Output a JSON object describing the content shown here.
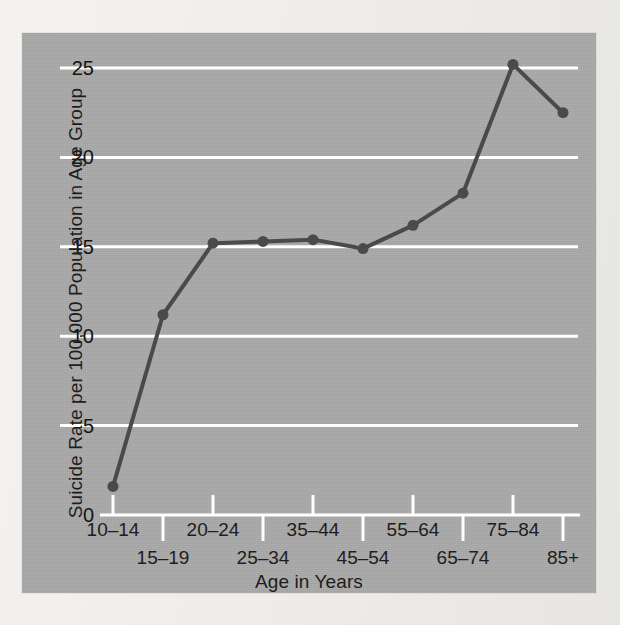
{
  "chart_data": {
    "type": "line",
    "title": "",
    "xlabel": "Age in Years",
    "ylabel": "Suicide Rate per 100,000 Population in Age Group",
    "categories": [
      "10–14",
      "15–19",
      "20–24",
      "25–34",
      "35–44",
      "45–54",
      "55–64",
      "65–74",
      "75–84",
      "85+"
    ],
    "values": [
      1.6,
      11.2,
      15.2,
      15.3,
      15.4,
      14.9,
      16.2,
      18.0,
      25.2,
      22.5
    ],
    "ylim": [
      0,
      26.5
    ],
    "yticks": [
      0,
      5,
      10,
      15,
      20,
      25
    ],
    "ytick_labels": [
      "0",
      "5",
      "10",
      "15",
      "20",
      "25"
    ],
    "grid": "horizontal-white-gridlines",
    "legend": "none",
    "series_color": "#4a4a4a",
    "gridline_color": "#ffffff",
    "plot_background": "#a9a9a9",
    "page_background": "#f3f1ed",
    "marker": "circle"
  },
  "axis_titles": {
    "x": "Age in Years",
    "y": "Suicide Rate per 100,000 Population in Age Group"
  },
  "y_ticks": [
    {
      "label": "25",
      "value": 25
    },
    {
      "label": "20",
      "value": 20
    },
    {
      "label": "15",
      "value": 15
    },
    {
      "label": "10",
      "value": 10
    },
    {
      "label": "5",
      "value": 5
    },
    {
      "label": "0",
      "value": 0
    }
  ],
  "x_ticks": [
    {
      "label": "10–14",
      "row": 0
    },
    {
      "label": "15–19",
      "row": 1
    },
    {
      "label": "20–24",
      "row": 0
    },
    {
      "label": "25–34",
      "row": 1
    },
    {
      "label": "35–44",
      "row": 0
    },
    {
      "label": "45–54",
      "row": 1
    },
    {
      "label": "55–64",
      "row": 0
    },
    {
      "label": "65–74",
      "row": 1
    },
    {
      "label": "75–84",
      "row": 0
    },
    {
      "label": "85+",
      "row": 1
    }
  ]
}
